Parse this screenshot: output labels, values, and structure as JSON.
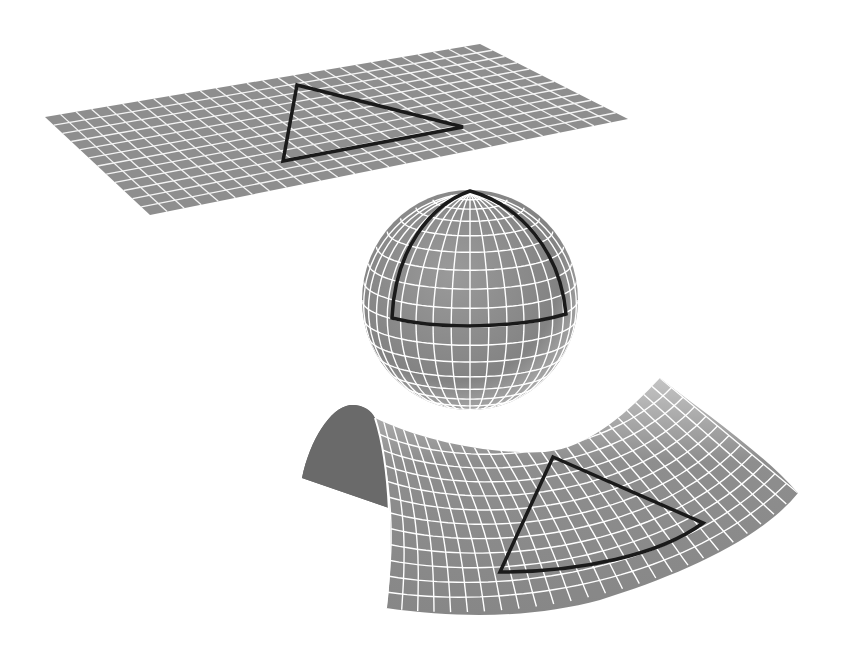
{
  "colors": {
    "background": "#ffffff",
    "surface": "#8c8c8c",
    "surface_dark": "#6e6e6e",
    "surface_light": "#b5b5b5",
    "grid": "#ffffff",
    "triangle": "#1a1a1a"
  },
  "shapes": [
    {
      "id": "plane",
      "label": "Flat plane (zero curvature)",
      "triangle": "Euclidean triangle"
    },
    {
      "id": "sphere",
      "label": "Sphere (positive curvature)",
      "triangle": "Spherical triangle"
    },
    {
      "id": "saddle",
      "label": "Saddle surface (negative curvature)",
      "triangle": "Hyperbolic triangle"
    }
  ]
}
